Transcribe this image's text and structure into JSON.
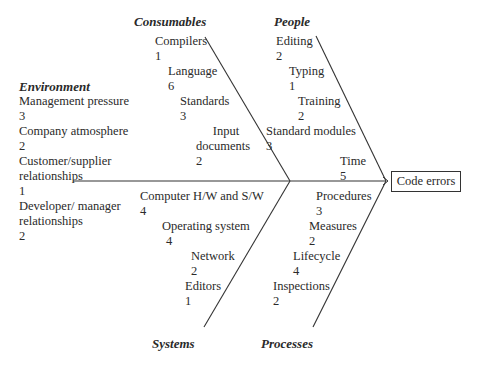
{
  "effect": "Code errors",
  "categories": {
    "consumables": {
      "title": "Consumables",
      "causes": [
        {
          "label": "Compilers",
          "count": "1"
        },
        {
          "label": "Language",
          "count": "6"
        },
        {
          "label": "Standards",
          "count": "3"
        },
        {
          "label": "Input documents",
          "label_line1": "Input",
          "label_line2": "documents",
          "count": "2"
        }
      ]
    },
    "people": {
      "title": "People",
      "causes": [
        {
          "label": "Editing",
          "count": "2"
        },
        {
          "label": "Typing",
          "count": "1"
        },
        {
          "label": "Training",
          "count": "2"
        },
        {
          "label": "Standard modules",
          "count": "3"
        },
        {
          "label": "Time",
          "count": "5"
        }
      ]
    },
    "environment": {
      "title": "Environment",
      "causes": [
        {
          "label": "Management pressure",
          "count": "3"
        },
        {
          "label": "Company atmosphere",
          "count": "2"
        },
        {
          "label": "Customer/supplier relationships",
          "label_line1": "Customer/supplier",
          "label_line2": "relationships",
          "count": "1"
        },
        {
          "label": "Developer/ manager relationships",
          "label_line1": "Developer/ manager",
          "label_line2": "relationships",
          "count": "2"
        }
      ]
    },
    "systems": {
      "title": "Systems",
      "causes": [
        {
          "label": "Computer H/W and S/W",
          "count": "4"
        },
        {
          "label": "Operating system",
          "count": "4"
        },
        {
          "label": "Network",
          "count": "2"
        },
        {
          "label": "Editors",
          "count": "1"
        }
      ]
    },
    "processes": {
      "title": "Processes",
      "causes": [
        {
          "label": "Procedures",
          "count": "3"
        },
        {
          "label": "Measures",
          "count": "2"
        },
        {
          "label": "Lifecycle",
          "count": "4"
        },
        {
          "label": "Inspections",
          "count": "2"
        }
      ]
    }
  },
  "colors": {
    "line": "#333333",
    "text": "#2a2a2a",
    "background": "#ffffff"
  }
}
